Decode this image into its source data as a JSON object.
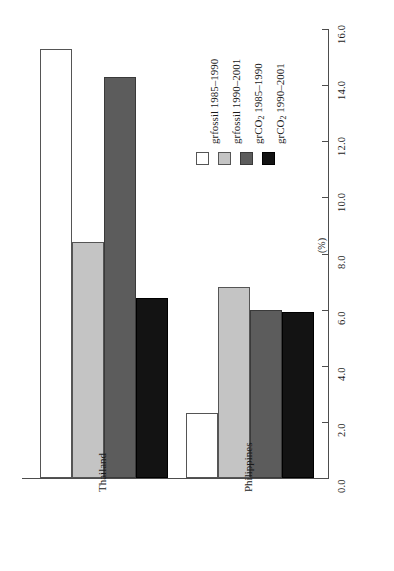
{
  "chart_data": {
    "type": "bar",
    "title": "",
    "subtitle": "",
    "orientation": "vertical-bars-rotated-90",
    "categories": [
      "Thailand",
      "Philippines"
    ],
    "xlabel": "",
    "ylabel": "(%)",
    "ylim": [
      0.0,
      16.0
    ],
    "yticks": [
      "0.0",
      "2.0",
      "4.0",
      "6.0",
      "8.0",
      "10.0",
      "12.0",
      "14.0",
      "16.0"
    ],
    "ytick_values": [
      0.0,
      2.0,
      4.0,
      6.0,
      8.0,
      10.0,
      12.0,
      14.0,
      16.0
    ],
    "grid": false,
    "legend_position": "top-right",
    "series": [
      {
        "name": "grfossil 1985–1990",
        "name_base": "grfossil",
        "name_sub": "",
        "name_tail": " 1985–1990",
        "color": "#ffffff",
        "values": [
          15.3,
          2.3
        ]
      },
      {
        "name": "grfossil 1990–2001",
        "name_base": "grfossil",
        "name_sub": "",
        "name_tail": " 1990–2001",
        "color": "#c4c4c4",
        "values": [
          8.4,
          6.8
        ]
      },
      {
        "name": "grCO2 1985–1990",
        "name_base": "grCO",
        "name_sub": "2",
        "name_tail": " 1985–1990",
        "color": "#5c5c5c",
        "values": [
          14.3,
          6.0
        ]
      },
      {
        "name": "grCO2 1990–2001",
        "name_base": "grCO",
        "name_sub": "2",
        "name_tail": " 1990–2001",
        "color": "#131313",
        "values": [
          6.4,
          5.9
        ]
      }
    ]
  },
  "axis": {
    "unit_label": "(%)"
  },
  "legend": {
    "entries": [
      "grfossil 1985–1990",
      "grfossil 1990–2001",
      "grCO2 1985–1990",
      "grCO2 1990–2001"
    ]
  }
}
